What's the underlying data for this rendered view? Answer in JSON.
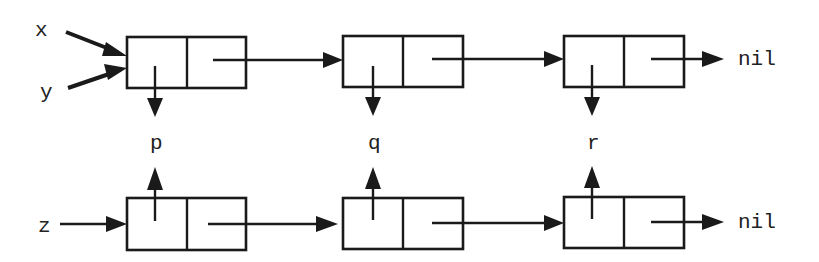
{
  "diagram": {
    "type": "linked-list-cons-cells",
    "variables": {
      "x": "x",
      "y": "y",
      "z": "z"
    },
    "values": [
      "p",
      "q",
      "r"
    ],
    "terminator": "nil",
    "lists": [
      {
        "name": "top-list",
        "pointers_in": [
          "x",
          "y"
        ],
        "cells": [
          {
            "car": "p",
            "car_direction": "down"
          },
          {
            "car": "q",
            "car_direction": "down"
          },
          {
            "car": "r",
            "car_direction": "down"
          }
        ],
        "end": "nil"
      },
      {
        "name": "bottom-list",
        "pointers_in": [
          "z"
        ],
        "cells": [
          {
            "car": "p",
            "car_direction": "up"
          },
          {
            "car": "q",
            "car_direction": "up"
          },
          {
            "car": "r",
            "car_direction": "up"
          }
        ],
        "end": "nil"
      }
    ],
    "colors": {
      "stroke": "#1a1a1a",
      "background": "#ffffff"
    }
  }
}
